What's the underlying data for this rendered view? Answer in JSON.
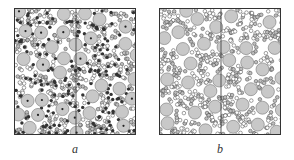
{
  "figure": {
    "panels": [
      {
        "id": "a",
        "label": "a",
        "description": "Packing of large grey particles (some with center markers) among small open circles and dark clustered small particles, with a vertical dividing line",
        "large_fill": "#c8c8c8",
        "small_stroke": "#444444",
        "dark_fill": "#333333"
      },
      {
        "id": "b",
        "label": "b",
        "description": "Packing of large grey particles among small open circles, with a vertical dividing line",
        "large_fill": "#c8c8c8",
        "small_stroke": "#444444"
      }
    ]
  }
}
